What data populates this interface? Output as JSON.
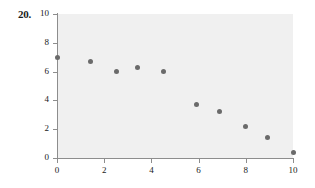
{
  "figure": {
    "problem_number": "20."
  },
  "chart_data": {
    "type": "scatter",
    "title": "",
    "xlabel": "",
    "ylabel": "",
    "xlim": [
      0,
      10
    ],
    "ylim": [
      0,
      10
    ],
    "xticks": [
      0,
      2,
      4,
      6,
      8,
      10
    ],
    "yticks": [
      0,
      2,
      4,
      6,
      8,
      10
    ],
    "xtick_labels": [
      "0",
      "2",
      "4",
      "6",
      "8",
      "10"
    ],
    "ytick_labels": [
      "0",
      "2",
      "4",
      "6",
      "8",
      "10"
    ],
    "grid": false,
    "legend": false,
    "legend_position": "none",
    "marker_color": "#6a6a6a",
    "panel_color": "#f0f0f0",
    "axis_color": "#8d8d8d",
    "points": [
      {
        "x": 0.0,
        "y": 7.0
      },
      {
        "x": 1.4,
        "y": 6.7
      },
      {
        "x": 2.5,
        "y": 6.0
      },
      {
        "x": 3.4,
        "y": 6.3
      },
      {
        "x": 4.5,
        "y": 6.0
      },
      {
        "x": 5.9,
        "y": 3.7
      },
      {
        "x": 6.9,
        "y": 3.2
      },
      {
        "x": 8.0,
        "y": 2.2
      },
      {
        "x": 8.9,
        "y": 1.4
      },
      {
        "x": 10.0,
        "y": 0.4
      }
    ]
  }
}
